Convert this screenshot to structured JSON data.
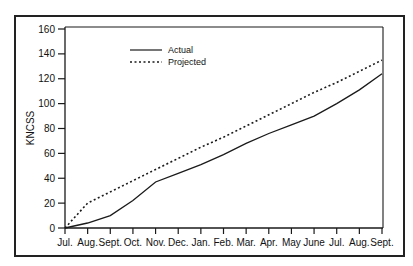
{
  "chart_data": {
    "type": "line",
    "title": "",
    "xlabel": "",
    "ylabel": "KNCSS",
    "ylim": [
      0,
      160
    ],
    "yticks": [
      0,
      20,
      40,
      60,
      80,
      100,
      120,
      140,
      160
    ],
    "categories": [
      "Jul.",
      "Aug.",
      "Sept.",
      "Oct.",
      "Nov.",
      "Dec.",
      "Jan.",
      "Feb.",
      "Mar.",
      "Apr.",
      "May",
      "June",
      "Jul.",
      "Aug.",
      "Sept."
    ],
    "series": [
      {
        "name": "Actual",
        "style": "solid",
        "values": [
          0,
          4,
          10,
          22,
          37,
          44,
          51,
          59,
          68,
          76,
          83,
          90,
          100,
          111,
          124
        ]
      },
      {
        "name": "Projected",
        "style": "dotted",
        "values": [
          0,
          20,
          29,
          38,
          47,
          56,
          65,
          73,
          82,
          91,
          100,
          109,
          117,
          126,
          135
        ]
      }
    ],
    "legend_position": "upper-left-inside",
    "grid": false
  },
  "colors": {
    "line": "#1a1a1a",
    "frame": "#222222",
    "background": "#ffffff"
  }
}
